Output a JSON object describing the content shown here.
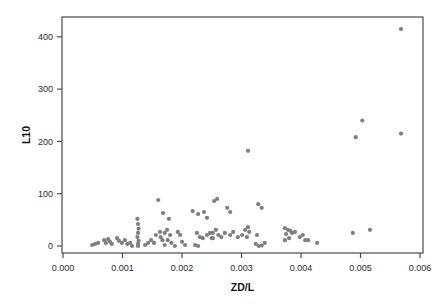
{
  "chart_data": {
    "type": "scatter",
    "title": "",
    "xlabel": "ZD/L",
    "ylabel": "L10",
    "xlim": [
      0,
      0.006
    ],
    "ylim": [
      0,
      438
    ],
    "grid": false,
    "legend": null,
    "point_color": "#7f7f7f",
    "frame_color": "#4a4a4a",
    "tick_color": "#2b2b2b",
    "background": "#ffffff",
    "x_ticks": {
      "values": [
        0,
        0.001,
        0.002,
        0.003,
        0.004,
        0.005,
        0.006
      ],
      "labels": [
        "0.000",
        "0.001",
        "0.002",
        "0.003",
        "0.004",
        "0.005",
        "0.006"
      ]
    },
    "y_ticks": {
      "values": [
        0,
        100,
        200,
        300,
        400
      ],
      "labels": [
        "0",
        "100",
        "200",
        "300",
        "400"
      ]
    },
    "points": [
      [
        0.00049,
        2
      ],
      [
        0.00054,
        4
      ],
      [
        0.00059,
        6
      ],
      [
        0.00069,
        11
      ],
      [
        0.00072,
        6
      ],
      [
        0.00076,
        13
      ],
      [
        0.00079,
        8
      ],
      [
        0.00082,
        4
      ],
      [
        0.00091,
        15
      ],
      [
        0.00094,
        10
      ],
      [
        0.00099,
        6
      ],
      [
        0.00104,
        11
      ],
      [
        0.00108,
        4
      ],
      [
        0.00113,
        6
      ],
      [
        0.00116,
        0
      ],
      [
        0.00125,
        52
      ],
      [
        0.00126,
        42
      ],
      [
        0.00127,
        33
      ],
      [
        0.00126,
        25
      ],
      [
        0.00125,
        17
      ],
      [
        0.00127,
        10
      ],
      [
        0.00126,
        4
      ],
      [
        0.00126,
        0
      ],
      [
        0.00138,
        2
      ],
      [
        0.00143,
        6
      ],
      [
        0.00148,
        11
      ],
      [
        0.00153,
        6
      ],
      [
        0.00156,
        21
      ],
      [
        0.0016,
        88
      ],
      [
        0.00163,
        27
      ],
      [
        0.00164,
        17
      ],
      [
        0.00167,
        11
      ],
      [
        0.00168,
        63
      ],
      [
        0.00171,
        25
      ],
      [
        0.00171,
        2
      ],
      [
        0.00175,
        31
      ],
      [
        0.00176,
        11
      ],
      [
        0.00178,
        52
      ],
      [
        0.0018,
        21
      ],
      [
        0.00182,
        6
      ],
      [
        0.00188,
        0
      ],
      [
        0.00193,
        27
      ],
      [
        0.00197,
        21
      ],
      [
        0.002,
        8
      ],
      [
        0.00205,
        2
      ],
      [
        0.00218,
        67
      ],
      [
        0.00222,
        2
      ],
      [
        0.00225,
        25
      ],
      [
        0.00227,
        61
      ],
      [
        0.00227,
        0
      ],
      [
        0.0023,
        17
      ],
      [
        0.00235,
        15
      ],
      [
        0.00237,
        65
      ],
      [
        0.00242,
        21
      ],
      [
        0.00242,
        54
      ],
      [
        0.00247,
        25
      ],
      [
        0.0025,
        15
      ],
      [
        0.00254,
        86
      ],
      [
        0.00259,
        90
      ],
      [
        0.00252,
        25
      ],
      [
        0.00252,
        15
      ],
      [
        0.00257,
        31
      ],
      [
        0.00261,
        21
      ],
      [
        0.00266,
        17
      ],
      [
        0.00272,
        25
      ],
      [
        0.00276,
        73
      ],
      [
        0.00281,
        65
      ],
      [
        0.00281,
        21
      ],
      [
        0.00286,
        27
      ],
      [
        0.00294,
        17
      ],
      [
        0.00301,
        21
      ],
      [
        0.00306,
        31
      ],
      [
        0.00309,
        17
      ],
      [
        0.00311,
        36
      ],
      [
        0.00313,
        27
      ],
      [
        0.00311,
        182
      ],
      [
        0.00324,
        4
      ],
      [
        0.00326,
        21
      ],
      [
        0.00329,
        0
      ],
      [
        0.00334,
        1
      ],
      [
        0.00339,
        6
      ],
      [
        0.00328,
        80
      ],
      [
        0.00334,
        73
      ],
      [
        0.00373,
        34
      ],
      [
        0.00375,
        23
      ],
      [
        0.00378,
        31
      ],
      [
        0.0038,
        15
      ],
      [
        0.00382,
        29
      ],
      [
        0.00385,
        25
      ],
      [
        0.00373,
        11
      ],
      [
        0.0039,
        27
      ],
      [
        0.00398,
        17
      ],
      [
        0.00403,
        21
      ],
      [
        0.00407,
        11
      ],
      [
        0.00412,
        11
      ],
      [
        0.00427,
        6
      ],
      [
        0.00487,
        25
      ],
      [
        0.00516,
        31
      ],
      [
        0.00492,
        208
      ],
      [
        0.00503,
        240
      ],
      [
        0.00568,
        415
      ],
      [
        0.00568,
        215
      ]
    ]
  }
}
